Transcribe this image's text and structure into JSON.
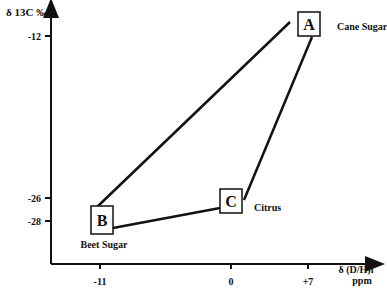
{
  "chart_data": {
    "type": "scatter",
    "title": "",
    "ylabel": "δ 13C ‰",
    "xlabel": "δ (D/H)i",
    "xlabel_unit": "ppm",
    "x_ticks": [
      "-11",
      "0",
      "+7"
    ],
    "y_ticks": [
      "-12",
      "-26",
      "-28"
    ],
    "points": [
      {
        "id": "A",
        "label": "Cane Sugar",
        "x": 7,
        "y": -12
      },
      {
        "id": "B",
        "label": "Beet Sugar",
        "x": -11,
        "y": -28
      },
      {
        "id": "C",
        "label": "Citrus",
        "x": 0,
        "y": -26
      }
    ],
    "edges": [
      [
        "A",
        "B"
      ],
      [
        "B",
        "C"
      ],
      [
        "C",
        "A"
      ]
    ]
  }
}
